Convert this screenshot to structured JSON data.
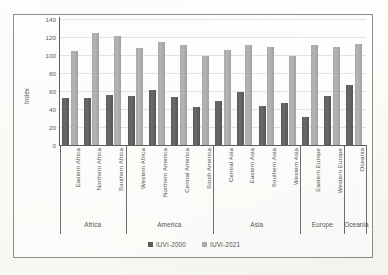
{
  "chart_data": {
    "type": "bar",
    "title": "",
    "xlabel": "",
    "ylabel": "Index",
    "ylim": [
      0,
      140
    ],
    "yticks": [
      0,
      20,
      40,
      60,
      80,
      100,
      120,
      140
    ],
    "grid": true,
    "legend_position": "bottom",
    "categories": [
      "Eastern Africa",
      "Northern Africa",
      "Southern Africa",
      "Western Africa",
      "Northern America",
      "Central America",
      "South America",
      "Central Asia",
      "Eastern Asia",
      "Southern Asia",
      "Western Asia",
      "Eastern Europe",
      "Western Europe",
      "Oceania"
    ],
    "groups": [
      {
        "label": "Africa",
        "span": 3
      },
      {
        "label": "America",
        "span": 4
      },
      {
        "label": "Asia",
        "span": 4
      },
      {
        "label": "Europe",
        "span": 2
      },
      {
        "label": "Oceania",
        "span": 1
      }
    ],
    "series": [
      {
        "name": "IUVI-2000",
        "color": "#5b5b5b",
        "values": [
          52,
          52,
          56,
          54,
          61,
          53,
          42,
          49,
          59,
          43,
          47,
          31,
          55,
          67
        ]
      },
      {
        "name": "IUVI-2021",
        "color": "#a9a9a7",
        "values": [
          104,
          125,
          121,
          108,
          115,
          111,
          99,
          106,
          111,
          109,
          99,
          111,
          109,
          112
        ]
      }
    ]
  }
}
